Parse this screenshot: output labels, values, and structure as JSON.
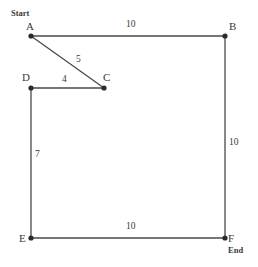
{
  "diagram": {
    "background_color": "#ffffff",
    "line_color": "#4a4a4a",
    "node_color": "#2b2b2b",
    "text_color": "#3a3a3a",
    "nodes": [
      {
        "id": "A",
        "label": "A",
        "x": 31,
        "y": 36,
        "label_x": 26,
        "label_y": 21,
        "terminal": "Start",
        "terminal_x": 11,
        "terminal_y": 9
      },
      {
        "id": "B",
        "label": "B",
        "x": 225,
        "y": 36,
        "label_x": 229,
        "label_y": 21,
        "terminal": "",
        "terminal_x": 0,
        "terminal_y": 0
      },
      {
        "id": "C",
        "label": "C",
        "x": 104,
        "y": 88,
        "label_x": 103,
        "label_y": 72,
        "terminal": "",
        "terminal_x": 0,
        "terminal_y": 0
      },
      {
        "id": "D",
        "label": "D",
        "x": 31,
        "y": 88,
        "label_x": 22,
        "label_y": 72,
        "terminal": "",
        "terminal_x": 0,
        "terminal_y": 0
      },
      {
        "id": "E",
        "label": "E",
        "x": 31,
        "y": 238,
        "label_x": 19,
        "label_y": 233,
        "terminal": "",
        "terminal_x": 0,
        "terminal_y": 0
      },
      {
        "id": "F",
        "label": "F",
        "x": 225,
        "y": 238,
        "label_x": 228,
        "label_y": 233,
        "terminal": "End",
        "terminal_x": 228,
        "terminal_y": 246
      }
    ],
    "edges": [
      {
        "id": "A-B",
        "from": "A",
        "to": "B",
        "weight": "10",
        "label_x": 126,
        "label_y": 20
      },
      {
        "id": "A-C",
        "from": "A",
        "to": "C",
        "weight": "5",
        "label_x": 76,
        "label_y": 55
      },
      {
        "id": "D-C",
        "from": "D",
        "to": "C",
        "weight": "4",
        "label_x": 62,
        "label_y": 75
      },
      {
        "id": "D-E",
        "from": "D",
        "to": "E",
        "weight": "7",
        "label_x": 35,
        "label_y": 150
      },
      {
        "id": "E-F",
        "from": "E",
        "to": "F",
        "weight": "10",
        "label_x": 126,
        "label_y": 222
      },
      {
        "id": "B-F",
        "from": "B",
        "to": "F",
        "weight": "10",
        "label_x": 229,
        "label_y": 138
      }
    ]
  }
}
